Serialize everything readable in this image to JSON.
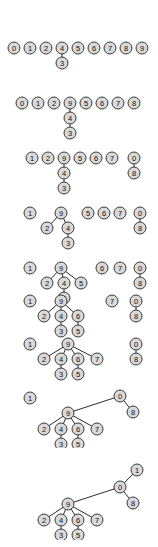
{
  "figure": {
    "node_fill": "#d9d9d9",
    "node_stroke": "#3a3a3a",
    "edge_color": "#2b2b2b",
    "background": "#ffffff",
    "node_radius": 6,
    "label_set": [
      "0",
      "1",
      "2",
      "3",
      "4",
      "5",
      "6",
      "7",
      "8",
      "9"
    ]
  },
  "stages": [
    {
      "index": 1,
      "top": 38,
      "height": 34,
      "nodes": [
        {
          "id": "0",
          "label": "0",
          "x": 14,
          "y": 10
        },
        {
          "id": "1",
          "label": "1",
          "x": 30,
          "y": 10
        },
        {
          "id": "2",
          "label": "2",
          "x": 46,
          "y": 10
        },
        {
          "id": "4",
          "label": "4",
          "x": 62,
          "y": 10
        },
        {
          "id": "5",
          "label": "5",
          "x": 78,
          "y": 10
        },
        {
          "id": "6",
          "label": "6",
          "x": 94,
          "y": 10
        },
        {
          "id": "7",
          "label": "7",
          "x": 110,
          "y": 10
        },
        {
          "id": "8",
          "label": "8",
          "x": 126,
          "y": 10
        },
        {
          "id": "9",
          "label": "9",
          "x": 142,
          "y": 10
        },
        {
          "id": "3",
          "label": "3",
          "x": 62,
          "y": 25
        }
      ],
      "edges": [
        [
          "4",
          "3"
        ]
      ]
    },
    {
      "index": 2,
      "top": 93,
      "height": 48,
      "nodes": [
        {
          "id": "0",
          "label": "0",
          "x": 22,
          "y": 10
        },
        {
          "id": "1",
          "label": "1",
          "x": 38,
          "y": 10
        },
        {
          "id": "2",
          "label": "2",
          "x": 54,
          "y": 10
        },
        {
          "id": "9",
          "label": "9",
          "x": 70,
          "y": 10
        },
        {
          "id": "5",
          "label": "5",
          "x": 86,
          "y": 10
        },
        {
          "id": "6",
          "label": "6",
          "x": 102,
          "y": 10
        },
        {
          "id": "7",
          "label": "7",
          "x": 118,
          "y": 10
        },
        {
          "id": "8",
          "label": "8",
          "x": 134,
          "y": 10
        },
        {
          "id": "4",
          "label": "4",
          "x": 70,
          "y": 25
        },
        {
          "id": "3",
          "label": "3",
          "x": 70,
          "y": 40
        }
      ],
      "edges": [
        [
          "9",
          "4"
        ],
        [
          "4",
          "3"
        ]
      ]
    },
    {
      "index": 3,
      "top": 148,
      "height": 48,
      "nodes": [
        {
          "id": "1",
          "label": "1",
          "x": 32,
          "y": 10
        },
        {
          "id": "2",
          "label": "2",
          "x": 48,
          "y": 10
        },
        {
          "id": "9",
          "label": "9",
          "x": 64,
          "y": 10
        },
        {
          "id": "5",
          "label": "5",
          "x": 80,
          "y": 10
        },
        {
          "id": "6",
          "label": "6",
          "x": 96,
          "y": 10
        },
        {
          "id": "7",
          "label": "7",
          "x": 112,
          "y": 10
        },
        {
          "id": "0",
          "label": "0",
          "x": 134,
          "y": 10
        },
        {
          "id": "8",
          "label": "8",
          "x": 134,
          "y": 25
        },
        {
          "id": "4",
          "label": "4",
          "x": 64,
          "y": 25
        },
        {
          "id": "3",
          "label": "3",
          "x": 64,
          "y": 40
        }
      ],
      "edges": [
        [
          "9",
          "4"
        ],
        [
          "4",
          "3"
        ],
        [
          "0",
          "8"
        ]
      ]
    },
    {
      "index": 4,
      "top": 203,
      "height": 48,
      "nodes": [
        {
          "id": "1",
          "label": "1",
          "x": 30,
          "y": 10
        },
        {
          "id": "9",
          "label": "9",
          "x": 61,
          "y": 10
        },
        {
          "id": "5",
          "label": "5",
          "x": 88,
          "y": 10
        },
        {
          "id": "6",
          "label": "6",
          "x": 104,
          "y": 10
        },
        {
          "id": "7",
          "label": "7",
          "x": 120,
          "y": 10
        },
        {
          "id": "0",
          "label": "0",
          "x": 140,
          "y": 10
        },
        {
          "id": "8",
          "label": "8",
          "x": 140,
          "y": 25
        },
        {
          "id": "2",
          "label": "2",
          "x": 47,
          "y": 25
        },
        {
          "id": "4",
          "label": "4",
          "x": 68,
          "y": 25
        },
        {
          "id": "3",
          "label": "3",
          "x": 68,
          "y": 40
        }
      ],
      "edges": [
        [
          "9",
          "2"
        ],
        [
          "9",
          "4"
        ],
        [
          "4",
          "3"
        ],
        [
          "0",
          "8"
        ]
      ]
    },
    {
      "index": 5,
      "top": 258,
      "height": 48,
      "nodes": [
        {
          "id": "1",
          "label": "1",
          "x": 30,
          "y": 10
        },
        {
          "id": "9",
          "label": "9",
          "x": 61,
          "y": 10
        },
        {
          "id": "6",
          "label": "6",
          "x": 102,
          "y": 10
        },
        {
          "id": "7",
          "label": "7",
          "x": 120,
          "y": 10
        },
        {
          "id": "0",
          "label": "0",
          "x": 140,
          "y": 10
        },
        {
          "id": "8",
          "label": "8",
          "x": 140,
          "y": 25
        },
        {
          "id": "2",
          "label": "2",
          "x": 47,
          "y": 25
        },
        {
          "id": "4",
          "label": "4",
          "x": 64,
          "y": 25
        },
        {
          "id": "5",
          "label": "5",
          "x": 81,
          "y": 25
        },
        {
          "id": "3",
          "label": "3",
          "x": 64,
          "y": 40
        }
      ],
      "edges": [
        [
          "9",
          "2"
        ],
        [
          "9",
          "4"
        ],
        [
          "9",
          "5"
        ],
        [
          "4",
          "3"
        ],
        [
          "0",
          "8"
        ]
      ]
    },
    {
      "index": 6,
      "top": 291,
      "height": 48,
      "nodes": [
        {
          "id": "1",
          "label": "1",
          "x": 30,
          "y": 10
        },
        {
          "id": "9",
          "label": "9",
          "x": 61,
          "y": 10
        },
        {
          "id": "7",
          "label": "7",
          "x": 112,
          "y": 10
        },
        {
          "id": "0",
          "label": "0",
          "x": 136,
          "y": 10
        },
        {
          "id": "8",
          "label": "8",
          "x": 136,
          "y": 25
        },
        {
          "id": "2",
          "label": "2",
          "x": 44,
          "y": 25
        },
        {
          "id": "4",
          "label": "4",
          "x": 61,
          "y": 25
        },
        {
          "id": "6",
          "label": "6",
          "x": 78,
          "y": 25
        },
        {
          "id": "3",
          "label": "3",
          "x": 61,
          "y": 40
        },
        {
          "id": "5",
          "label": "5",
          "x": 78,
          "y": 40
        }
      ],
      "edges": [
        [
          "9",
          "2"
        ],
        [
          "9",
          "4"
        ],
        [
          "9",
          "6"
        ],
        [
          "4",
          "3"
        ],
        [
          "6",
          "5"
        ],
        [
          "0",
          "8"
        ]
      ]
    },
    {
      "index": 7,
      "top": 334,
      "height": 48,
      "nodes": [
        {
          "id": "1",
          "label": "1",
          "x": 30,
          "y": 10
        },
        {
          "id": "9",
          "label": "9",
          "x": 68,
          "y": 10
        },
        {
          "id": "0",
          "label": "0",
          "x": 136,
          "y": 10
        },
        {
          "id": "8",
          "label": "8",
          "x": 136,
          "y": 25
        },
        {
          "id": "2",
          "label": "2",
          "x": 44,
          "y": 25
        },
        {
          "id": "4",
          "label": "4",
          "x": 61,
          "y": 25
        },
        {
          "id": "6",
          "label": "6",
          "x": 78,
          "y": 25
        },
        {
          "id": "7",
          "label": "7",
          "x": 97,
          "y": 25
        },
        {
          "id": "3",
          "label": "3",
          "x": 61,
          "y": 40
        },
        {
          "id": "5",
          "label": "5",
          "x": 78,
          "y": 40
        }
      ],
      "edges": [
        [
          "9",
          "2"
        ],
        [
          "9",
          "4"
        ],
        [
          "9",
          "6"
        ],
        [
          "9",
          "7"
        ],
        [
          "4",
          "3"
        ],
        [
          "6",
          "5"
        ],
        [
          "0",
          "8"
        ]
      ]
    },
    {
      "index": 8,
      "top": 386,
      "height": 62,
      "nodes": [
        {
          "id": "1",
          "label": "1",
          "x": 30,
          "y": 12
        },
        {
          "id": "0",
          "label": "0",
          "x": 120,
          "y": 10
        },
        {
          "id": "8",
          "label": "8",
          "x": 133,
          "y": 26
        },
        {
          "id": "9",
          "label": "9",
          "x": 68,
          "y": 27
        },
        {
          "id": "2",
          "label": "2",
          "x": 44,
          "y": 43
        },
        {
          "id": "4",
          "label": "4",
          "x": 61,
          "y": 43
        },
        {
          "id": "6",
          "label": "6",
          "x": 78,
          "y": 43
        },
        {
          "id": "7",
          "label": "7",
          "x": 97,
          "y": 43
        },
        {
          "id": "3",
          "label": "3",
          "x": 61,
          "y": 58
        },
        {
          "id": "5",
          "label": "5",
          "x": 78,
          "y": 58
        }
      ],
      "edges": [
        [
          "0",
          "9"
        ],
        [
          "0",
          "8"
        ],
        [
          "9",
          "2"
        ],
        [
          "9",
          "4"
        ],
        [
          "9",
          "6"
        ],
        [
          "9",
          "7"
        ],
        [
          "4",
          "3"
        ],
        [
          "6",
          "5"
        ]
      ]
    },
    {
      "index": 9,
      "top": 462,
      "height": 78,
      "nodes": [
        {
          "id": "1",
          "label": "1",
          "x": 137,
          "y": 8
        },
        {
          "id": "0",
          "label": "0",
          "x": 120,
          "y": 25
        },
        {
          "id": "8",
          "label": "8",
          "x": 133,
          "y": 41
        },
        {
          "id": "9",
          "label": "9",
          "x": 68,
          "y": 42
        },
        {
          "id": "2",
          "label": "2",
          "x": 44,
          "y": 58
        },
        {
          "id": "4",
          "label": "4",
          "x": 61,
          "y": 58
        },
        {
          "id": "6",
          "label": "6",
          "x": 78,
          "y": 58
        },
        {
          "id": "7",
          "label": "7",
          "x": 97,
          "y": 58
        },
        {
          "id": "3",
          "label": "3",
          "x": 61,
          "y": 73
        },
        {
          "id": "5",
          "label": "5",
          "x": 78,
          "y": 73
        }
      ],
      "edges": [
        [
          "1",
          "0"
        ],
        [
          "0",
          "9"
        ],
        [
          "0",
          "8"
        ],
        [
          "9",
          "2"
        ],
        [
          "9",
          "4"
        ],
        [
          "9",
          "6"
        ],
        [
          "9",
          "7"
        ],
        [
          "4",
          "3"
        ],
        [
          "6",
          "5"
        ]
      ]
    }
  ]
}
